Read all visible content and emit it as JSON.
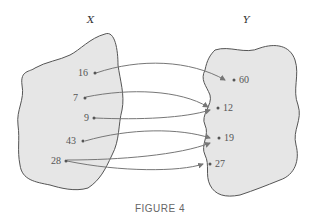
{
  "caption": "FIGURE 4",
  "set_x": {
    "label": "X",
    "elements": [
      "16",
      "7",
      "9",
      "43",
      "28"
    ]
  },
  "set_y": {
    "label": "Y",
    "elements": [
      "60",
      "12",
      "19",
      "27"
    ]
  },
  "mappings": [
    {
      "from": "16",
      "to": "60"
    },
    {
      "from": "7",
      "to": "12"
    },
    {
      "from": "9",
      "to": "12"
    },
    {
      "from": "43",
      "to": "19"
    },
    {
      "from": "28",
      "to": "19"
    },
    {
      "from": "28",
      "to": "27"
    }
  ],
  "colors": {
    "blob_fill": "#e6e6e6",
    "blob_stroke": "#555555",
    "arrow": "#777777"
  }
}
